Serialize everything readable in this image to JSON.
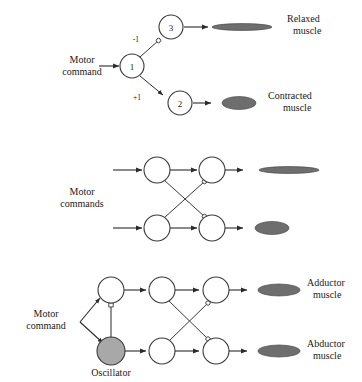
{
  "figure": {
    "type": "neural-circuit-diagram",
    "background_color": "#ffffff",
    "line_color": "#3a3a3a",
    "node_fill": "#ffffff",
    "node_stroke": "#3a3a3a",
    "oscillator_fill": "#a8a8a8",
    "muscle_fill": "#6e6e6e"
  },
  "panels": [
    {
      "id": "panel-top",
      "input_label": "Motor\ncommand",
      "input_label_line1": "Motor",
      "input_label_line2": "command",
      "nodes": [
        {
          "id": "n1",
          "label": "1"
        },
        {
          "id": "n2",
          "label": "2"
        },
        {
          "id": "n3",
          "label": "3"
        }
      ],
      "weights": [
        {
          "id": "w-inhibitory",
          "label": "-1",
          "from": "1",
          "to": "3",
          "type": "inhibitory"
        },
        {
          "id": "w-excitatory",
          "label": "+1",
          "from": "1",
          "to": "2",
          "type": "excitatory"
        }
      ],
      "outputs": [
        {
          "id": "muscle-relaxed",
          "label_line1": "Relaxed",
          "label_line2": "muscle",
          "state": "relaxed"
        },
        {
          "id": "muscle-contracted",
          "label_line1": "Contracted",
          "label_line2": "muscle",
          "state": "contracted"
        }
      ]
    },
    {
      "id": "panel-middle",
      "input_label_line1": "Motor",
      "input_label_line2": "commands",
      "nodes": [
        {
          "id": "m-top-left",
          "label": ""
        },
        {
          "id": "m-top-right",
          "label": ""
        },
        {
          "id": "m-bottom-left",
          "label": ""
        },
        {
          "id": "m-bottom-right",
          "label": ""
        }
      ],
      "outputs": [
        {
          "id": "muscle-upper",
          "label_line1": "",
          "label_line2": "",
          "state": "relaxed"
        },
        {
          "id": "muscle-lower",
          "label_line1": "",
          "label_line2": "",
          "state": "contracted"
        }
      ]
    },
    {
      "id": "panel-bottom",
      "input_label_line1": "Motor",
      "input_label_line2": "command",
      "oscillator_label": "Oscillator",
      "nodes": [
        {
          "id": "b-top-left",
          "label": ""
        },
        {
          "id": "b-oscillator",
          "label": ""
        },
        {
          "id": "b-top-mid",
          "label": ""
        },
        {
          "id": "b-bottom-mid",
          "label": ""
        },
        {
          "id": "b-top-right",
          "label": ""
        },
        {
          "id": "b-bottom-right",
          "label": ""
        }
      ],
      "outputs": [
        {
          "id": "muscle-adductor",
          "label_line1": "Adductor",
          "label_line2": "muscle",
          "state": "contracted"
        },
        {
          "id": "muscle-abductor",
          "label_line1": "Abductor",
          "label_line2": "muscle",
          "state": "contracted"
        }
      ]
    }
  ]
}
